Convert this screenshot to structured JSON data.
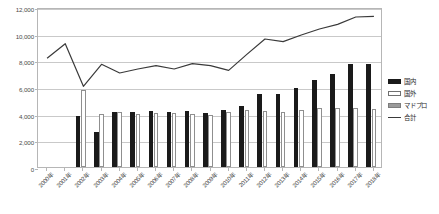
{
  "chart_data": {
    "type": "bar",
    "title": "",
    "subtitle": "",
    "xlabel": "",
    "ylabel": "",
    "ylim": [
      0,
      12000
    ],
    "ytick_labels": [
      "12,000",
      "10,000",
      "8,000",
      "6,000",
      "4,000",
      "2,000",
      "0"
    ],
    "ytick_values": [
      12000,
      10000,
      8000,
      6000,
      4000,
      2000,
      0
    ],
    "grid": true,
    "legend_position": "right",
    "categories": [
      "2000年",
      "2001年",
      "2002年",
      "2003年",
      "2004年",
      "2005年",
      "2006年",
      "2007年",
      "2008年",
      "2009年",
      "2010年",
      "2011年",
      "2012年",
      "2013年",
      "2014年",
      "2015年",
      "2016年",
      "2017年",
      "2018年"
    ],
    "series": [
      {
        "name": "国内",
        "type": "bar",
        "color": "#1a1a1a",
        "values": [
          null,
          null,
          3800,
          2600,
          4150,
          4100,
          4200,
          4150,
          4200,
          4050,
          4300,
          4600,
          5500,
          5450,
          5900,
          6500,
          7000,
          7700,
          7700
        ]
      },
      {
        "name": "国外",
        "type": "bar",
        "color": "#ffffff",
        "values": [
          null,
          null,
          5750,
          3950,
          4100,
          4000,
          4050,
          4050,
          4000,
          3900,
          4150,
          4250,
          4200,
          4150,
          4300,
          4400,
          4400,
          4400,
          4350
        ]
      },
      {
        "name": "マドプロ",
        "type": "bar",
        "color": "#8c8c8c",
        "values": [
          null,
          null,
          0,
          0,
          0,
          0,
          0,
          0,
          0,
          0,
          0,
          0,
          0,
          0,
          0,
          0,
          0,
          0,
          0
        ]
      },
      {
        "name": "合計",
        "type": "line",
        "color": "#3a3a3a",
        "values": [
          8300,
          9400,
          6200,
          7850,
          7200,
          7500,
          7750,
          7500,
          7900,
          7750,
          7400,
          8600,
          9750,
          9550,
          10050,
          10500,
          10850,
          11400,
          11450
        ]
      }
    ]
  },
  "legend": {
    "items": [
      {
        "label": "国内",
        "swatch": "bar-black"
      },
      {
        "label": "国外",
        "swatch": "bar-white"
      },
      {
        "label": "マドプロ",
        "swatch": "bar-gray"
      },
      {
        "label": "合計",
        "swatch": "line"
      }
    ]
  }
}
